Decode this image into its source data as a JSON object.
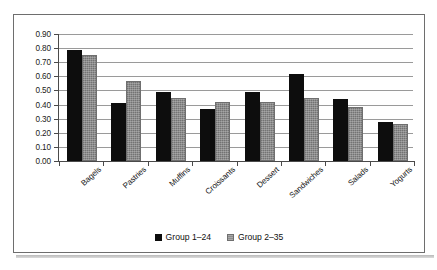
{
  "chart_data": {
    "type": "bar",
    "title": "",
    "subtitle": "",
    "xlabel": "",
    "ylabel": "",
    "categories": [
      "Bagels",
      "Pastries",
      "Muffins",
      "Croissants",
      "Dessert",
      "Sandwiches",
      "Salads",
      "Yogurts"
    ],
    "series": [
      {
        "name": "Group 1–24",
        "color": "#0d0d0d",
        "values": [
          0.79,
          0.41,
          0.49,
          0.37,
          0.49,
          0.615,
          0.44,
          0.275
        ]
      },
      {
        "name": "Group 2–35",
        "color": "#8c8c8c",
        "values": [
          0.75,
          0.57,
          0.45,
          0.42,
          0.42,
          0.445,
          0.385,
          0.265
        ]
      }
    ],
    "ylim": [
      0.0,
      0.9
    ],
    "ytick_step": 0.1,
    "ytick_labels": [
      "0.00",
      "0.10",
      "0.20",
      "0.30",
      "0.40",
      "0.50",
      "0.60",
      "0.70",
      "0.80",
      "0.90"
    ],
    "grid": true,
    "grid_axis": "y",
    "legend_position": "bottom",
    "xtick_label_rotation": -42,
    "frame_border_color": "#6e6e6e",
    "gridline_color": "#9a9a9a",
    "axis_color": "#4a4a4a",
    "background": "#ffffff"
  },
  "legend": {
    "entries": [
      {
        "label": "Group 1–24"
      },
      {
        "label": "Group 2–35"
      }
    ]
  }
}
